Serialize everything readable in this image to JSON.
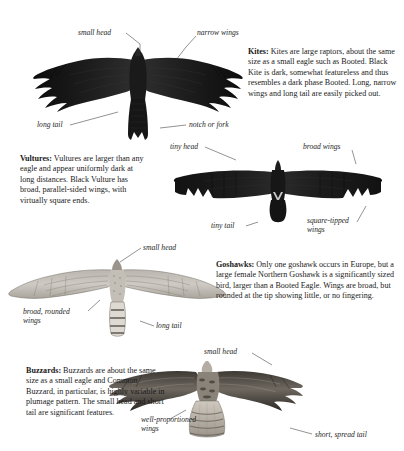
{
  "page": {
    "background": "#ffffff",
    "ink": "#111111"
  },
  "blocks": [
    {
      "id": "kites",
      "lead": "Kites:",
      "body": " Kites are large raptors, about the same size as a small eagle such as Booted. Black Kite is dark, somewhat featureless and thus resembles a dark phase Booted. Long, narrow wings and long tail are easily picked out."
    },
    {
      "id": "vultures",
      "lead": "Vultures:",
      "body": " Vultures are larger than any eagle and appear uniformly dark at long distances. Black Vulture has broad, parallel-sided wings, with virtually square ends."
    },
    {
      "id": "goshawks",
      "lead": "Goshawks:",
      "body": " Only one goshawk occurs in Europe, but a large female Northern Goshawk is a significantly sized bird, larger than a Booted Eagle. Wings are broad, but rounded at the tip showing little, or no fingering."
    },
    {
      "id": "buzzards",
      "lead": "Buzzards:",
      "body": " Buzzards are about the same size as a small eagle and Common Buzzard, in particular, is highly variable in plumage pattern. The small head and short tail are significant features."
    }
  ],
  "labels": {
    "kite_small_head": "small head",
    "kite_narrow_wings": "narrow wings",
    "kite_long_tail": "long tail",
    "kite_notch_or_fork": "notch or fork",
    "vulture_tiny_head": "tiny head",
    "vulture_broad_wings": "broad wings",
    "vulture_tiny_tail": "tiny tail",
    "vulture_square_tipped_wings": "square-tipped wings",
    "goshawk_small_head": "small head",
    "goshawk_broad_rounded_wings": "broad, rounded wings",
    "goshawk_long_tail": "long tail",
    "buzzard_small_head": "small head",
    "buzzard_well_proportioned_wings": "well-proportioned wings",
    "buzzard_short_spread_tail": "short, spread tail"
  },
  "figures": {
    "kite": "black-kite-silhouette",
    "vulture": "black-vulture-silhouette",
    "goshawk": "northern-goshawk-pale-illustration",
    "buzzard": "common-buzzard-illustration"
  }
}
